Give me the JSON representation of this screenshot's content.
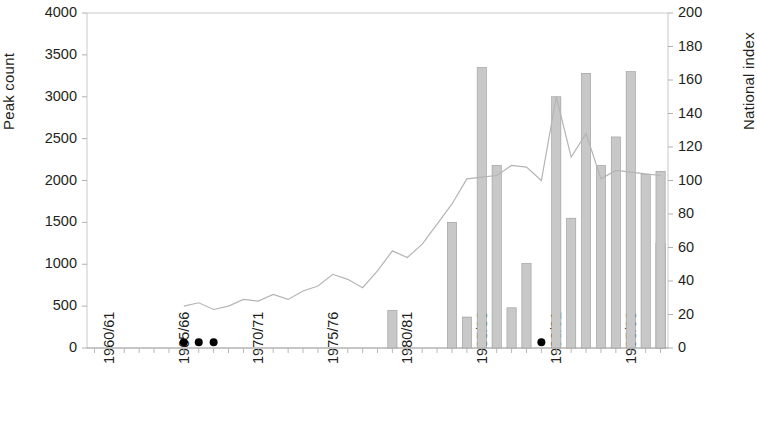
{
  "chart_data": {
    "type": "bar",
    "title": "",
    "subtitle": "",
    "xlabel": "",
    "ylabel": "Peak count",
    "y2label": "National index",
    "ylim": [
      0,
      4000
    ],
    "y2lim": [
      0,
      200
    ],
    "grid": false,
    "legend": "none",
    "y_ticks": [
      "0",
      "500",
      "1000",
      "1500",
      "2000",
      "2500",
      "3000",
      "3500",
      "4000"
    ],
    "y_tick_values": [
      0,
      500,
      1000,
      1500,
      2000,
      2500,
      3000,
      3500,
      4000
    ],
    "y2_ticks": [
      "0",
      "20",
      "40",
      "60",
      "80",
      "100",
      "120",
      "140",
      "160",
      "180",
      "200"
    ],
    "y2_tick_values": [
      0,
      20,
      40,
      60,
      80,
      100,
      120,
      140,
      160,
      180,
      200
    ],
    "x_tick_labels": [
      "1960/61",
      "1965/66",
      "1970/71",
      "1975/76",
      "1980/81",
      "1985/86",
      "1990/91",
      "1995/96"
    ],
    "x_tick_label_seasons": [
      "1960/61",
      "1965/66",
      "1970/71",
      "1975/76",
      "1980/81",
      "1985/86",
      "1990/91",
      "1995/96"
    ],
    "categories": [
      "1960/61",
      "1961/62",
      "1962/63",
      "1963/64",
      "1964/65",
      "1965/66",
      "1966/67",
      "1967/68",
      "1968/69",
      "1969/70",
      "1970/71",
      "1971/72",
      "1972/73",
      "1973/74",
      "1974/75",
      "1975/76",
      "1976/77",
      "1977/78",
      "1978/79",
      "1979/80",
      "1980/81",
      "1981/82",
      "1982/83",
      "1983/84",
      "1984/85",
      "1985/86",
      "1986/87",
      "1987/88",
      "1988/89",
      "1989/90",
      "1990/91",
      "1991/92",
      "1992/93",
      "1993/94",
      "1994/95",
      "1995/96",
      "1996/97",
      "1997/98",
      "1998/99"
    ],
    "series": [
      {
        "name": "Peak count",
        "type": "bar",
        "axis": "left",
        "color": "#c8c8c8",
        "values": [
          null,
          null,
          null,
          null,
          null,
          null,
          null,
          null,
          null,
          null,
          null,
          null,
          null,
          null,
          null,
          null,
          null,
          null,
          null,
          null,
          450,
          null,
          null,
          null,
          1500,
          370,
          3350,
          2180,
          480,
          1010,
          null,
          3000,
          1550,
          3280,
          2180,
          2520,
          3300,
          2070,
          1250
        ]
      },
      {
        "name": "National index",
        "type": "line",
        "axis": "right",
        "color": "#b4b4b4",
        "values": [
          null,
          null,
          null,
          null,
          null,
          null,
          25,
          27,
          23,
          25,
          29,
          28,
          32,
          29,
          34,
          37,
          44,
          41,
          36,
          46,
          58,
          54,
          62,
          74,
          86,
          101,
          102,
          103,
          109,
          108,
          100,
          150,
          114,
          128,
          101,
          106,
          105,
          104,
          103
        ]
      }
    ],
    "extra_markers": {
      "name": "zero-count-markers",
      "color": "#000000",
      "points": [
        {
          "category": "1966/67",
          "value": 70
        },
        {
          "category": "1967/68",
          "value": 70
        },
        {
          "category": "1968/69",
          "value": 70
        },
        {
          "category": "1990/91",
          "value": 70
        }
      ]
    },
    "last_bar_value": 2110,
    "note": ""
  },
  "axes": {
    "left_title": "Peak count",
    "right_title": "National index"
  }
}
